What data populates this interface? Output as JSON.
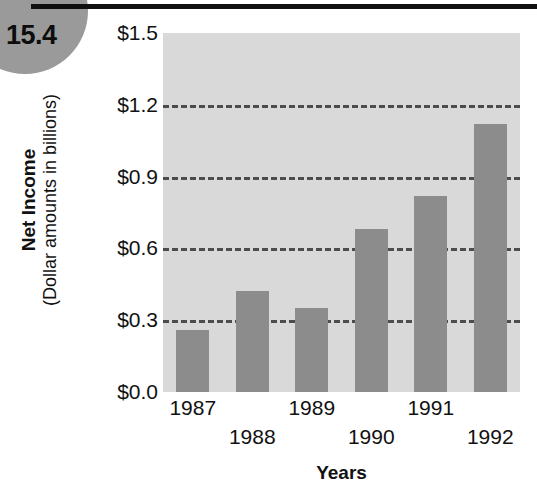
{
  "badge": {
    "number": "15.4"
  },
  "chart_data": {
    "type": "bar",
    "title": "",
    "xlabel": "Years",
    "ylabel": "Net Income",
    "ylabel_sub": "(Dollar amounts in billions)",
    "categories": [
      "1987",
      "1988",
      "1989",
      "1990",
      "1991",
      "1992"
    ],
    "values": [
      0.26,
      0.42,
      0.35,
      0.68,
      0.82,
      1.12
    ],
    "series": [
      {
        "name": "Net Income",
        "values": [
          0.26,
          0.42,
          0.35,
          0.68,
          0.82,
          1.12
        ]
      }
    ],
    "ylim": [
      0.0,
      1.5
    ],
    "ytick_values": [
      1.5,
      1.2,
      0.9,
      0.6,
      0.3,
      0.0
    ],
    "ytick_labels": [
      "$1.5",
      "$1.2",
      "$0.9",
      "$0.6",
      "$0.3",
      "$0.0"
    ],
    "gridlines_at": [
      1.2,
      0.9,
      0.6,
      0.3
    ],
    "grid": true,
    "legend": "none",
    "bar_color": "#8c8c8c",
    "plot_background": "#d9d9d9",
    "gridline_color": "#4d4d4d",
    "xtick_rows": [
      0,
      1,
      0,
      1,
      0,
      1
    ]
  }
}
